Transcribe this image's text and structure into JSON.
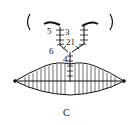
{
  "figure": {
    "caption": "C",
    "labels": {
      "l5": "5",
      "l3": "3",
      "l21": "21",
      "l6": "6",
      "l4": "4"
    }
  }
}
